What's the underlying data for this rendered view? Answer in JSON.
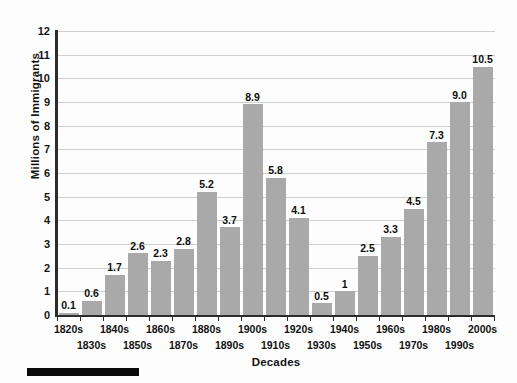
{
  "chart_data": {
    "type": "bar",
    "title": "",
    "xlabel": "Decades",
    "ylabel": "Millions of Immigrants",
    "ylim": [
      0,
      12
    ],
    "yticks": [
      0,
      1,
      2,
      3,
      4,
      5,
      6,
      7,
      8,
      9,
      10,
      11,
      12
    ],
    "grid": true,
    "legend": "none",
    "bar_color": "#a9a9a9",
    "categories": [
      "1820s",
      "1830s",
      "1840s",
      "1850s",
      "1860s",
      "1870s",
      "1880s",
      "1890s",
      "1900s",
      "1910s",
      "1920s",
      "1930s",
      "1940s",
      "1950s",
      "1960s",
      "1970s",
      "1980s",
      "1990s",
      "2000s"
    ],
    "values": [
      0.1,
      0.6,
      1.7,
      2.6,
      2.3,
      2.8,
      5.2,
      3.7,
      8.9,
      5.8,
      4.1,
      0.5,
      1,
      2.5,
      3.3,
      4.5,
      7.3,
      9.0,
      10.5
    ],
    "value_labels": [
      "0.1",
      "0.6",
      "1.7",
      "2.6",
      "2.3",
      "2.8",
      "5.2",
      "3.7",
      "8.9",
      "5.8",
      "4.1",
      "0.5",
      "1",
      "2.5",
      "3.3",
      "4.5",
      "7.3",
      "9.0",
      "10.5"
    ]
  },
  "axes": {
    "y_title": "Millions of Immigrants",
    "x_title": "Decades",
    "y_tick_labels": [
      "12",
      "11",
      "10",
      "9",
      "8",
      "7",
      "6",
      "5",
      "4",
      "3",
      "2",
      "1",
      "0"
    ]
  }
}
